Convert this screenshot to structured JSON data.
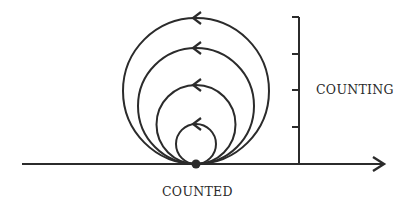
{
  "diagram": {
    "labels": {
      "counting": "COUNTING",
      "counted": "COUNTED"
    },
    "colors": {
      "stroke": "#2b2b2b",
      "background": "#ffffff"
    },
    "baseline": {
      "x1": 22,
      "x2": 385,
      "y": 164,
      "arrow": "right"
    },
    "vertical_scale": {
      "x": 299,
      "y_top": 17,
      "y_bottom": 164,
      "ticks_y": [
        17,
        54,
        90,
        127
      ]
    },
    "origin_point": {
      "x": 196,
      "y": 164
    },
    "circles": [
      {
        "radius": 20,
        "arrow_direction": "counterclockwise"
      },
      {
        "radius": 39.5,
        "arrow_direction": "counterclockwise"
      },
      {
        "radius": 58,
        "arrow_direction": "counterclockwise"
      },
      {
        "radius": 73,
        "arrow_direction": "counterclockwise"
      }
    ]
  }
}
